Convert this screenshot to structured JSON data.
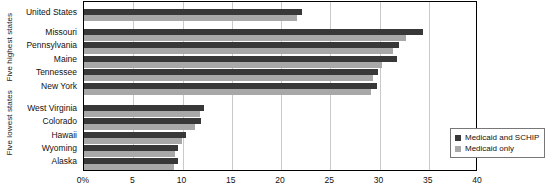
{
  "chart_data": {
    "type": "bar",
    "orientation": "horizontal",
    "title": "",
    "xlabel": "",
    "ylabel": "",
    "xlim": [
      0,
      40
    ],
    "xticks": [
      0,
      5,
      10,
      15,
      20,
      25,
      30,
      35,
      40
    ],
    "xtick_labels": [
      "0%",
      "5",
      "10",
      "15",
      "20",
      "25",
      "30",
      "35",
      "40"
    ],
    "grid": true,
    "legend_position": "lower right",
    "categories": [
      "United States",
      "Missouri",
      "Pennsylvania",
      "Maine",
      "Tennessee",
      "New York",
      "West Virginia",
      "Colorado",
      "Hawaii",
      "Wyoming",
      "Alaska"
    ],
    "series": [
      {
        "name": "Medicaid and SCHIP",
        "color": "#383838",
        "values": [
          22.1,
          34.4,
          32.0,
          31.8,
          29.8,
          29.7,
          12.2,
          11.9,
          10.4,
          9.5,
          9.5
        ]
      },
      {
        "name": "Medicaid only",
        "color": "#a8a8a8",
        "values": [
          21.6,
          32.7,
          31.4,
          30.3,
          29.3,
          29.1,
          11.8,
          11.3,
          9.9,
          9.2,
          9.1
        ]
      }
    ],
    "groups": [
      {
        "label": "Five highest states",
        "categories": [
          "Missouri",
          "Pennsylvania",
          "Maine",
          "Tennessee",
          "New York"
        ]
      },
      {
        "label": "Five lowest states",
        "categories": [
          "West Virginia",
          "Colorado",
          "Hawaii",
          "Wyoming",
          "Alaska"
        ]
      }
    ]
  },
  "legend": {
    "items": [
      {
        "label": "Medicaid and SCHIP",
        "color": "#383838"
      },
      {
        "label": "Medicaid only",
        "color": "#a8a8a8"
      }
    ]
  }
}
